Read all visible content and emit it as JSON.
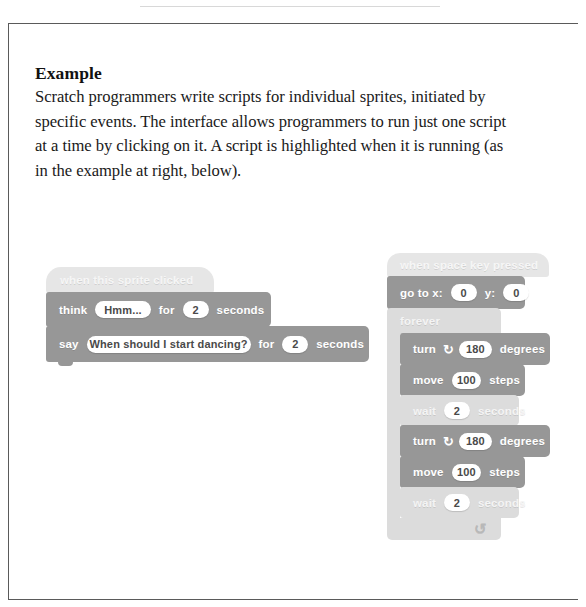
{
  "callout": {
    "heading": "Example",
    "body": "Scratch programmers write scripts for individual sprites, initiated by specific events. The interface allows programmers to run just one script at a time by clicking on it. A script is highlighted when it is running (as in the example at right, below)."
  },
  "scripts": {
    "left": {
      "name": "inactive-script",
      "hat": {
        "label": "when this sprite clicked"
      },
      "blocks": [
        {
          "name": "think-block",
          "label_start": "think",
          "input_text": "Hmm...",
          "label_mid": "for",
          "input_num": "2",
          "label_end": "seconds"
        },
        {
          "name": "say-block",
          "label_start": "say",
          "input_text": "When should I start dancing?",
          "label_mid": "for",
          "input_num": "2",
          "label_end": "seconds"
        }
      ]
    },
    "right": {
      "name": "running-highlighted-script",
      "hat": {
        "label": "when space key pressed"
      },
      "goto": {
        "label_start": "go to x:",
        "input_x": "0",
        "label_mid": "y:",
        "input_y": "0"
      },
      "forever": {
        "label": "forever",
        "loop_arrow": "↺",
        "body": [
          {
            "name": "turn-block",
            "label_start": "turn",
            "icon": "turn-clockwise-icon",
            "icon_glyph": "↻",
            "input_num": "180",
            "label_end": "degrees"
          },
          {
            "name": "move-block",
            "label_start": "move",
            "input_num": "100",
            "label_end": "steps"
          },
          {
            "name": "wait-block",
            "label_start": "wait",
            "input_num": "2",
            "label_end": "seconds"
          },
          {
            "name": "turn-block",
            "label_start": "turn",
            "icon": "turn-clockwise-icon",
            "icon_glyph": "↻",
            "input_num": "180",
            "label_end": "degrees"
          },
          {
            "name": "move-block",
            "label_start": "move",
            "input_num": "100",
            "label_end": "steps"
          },
          {
            "name": "wait-block",
            "label_start": "wait",
            "input_num": "2",
            "label_end": "seconds"
          }
        ]
      }
    }
  },
  "colors": {
    "frame_border": "#5a5a5a",
    "block_dark": "#979797",
    "block_mid": "#b9b9b9",
    "block_light": "#dcdcdc",
    "block_hat": "#e6e6e6",
    "input_fill": "#ffffff",
    "text_body": "#1a1a1a"
  }
}
